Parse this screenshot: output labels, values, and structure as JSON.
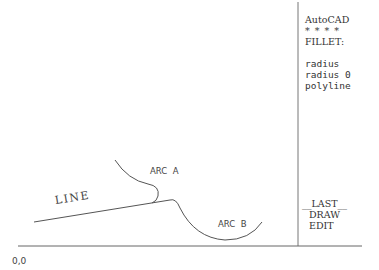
{
  "screen_menu": {
    "title": "AutoCAD",
    "separator": "* * * *",
    "command": "FILLET:",
    "options": [
      "radius",
      "radius 0",
      "polyline"
    ],
    "footer": [
      "__LAST__",
      "DRAW",
      "EDIT"
    ]
  },
  "drawing": {
    "labels": {
      "line": "LINE",
      "arc_a": "ARC  A",
      "arc_b": "ARC  B",
      "origin": "0,0"
    },
    "colors": {
      "stroke": "#555555",
      "background": "#ffffff"
    }
  }
}
